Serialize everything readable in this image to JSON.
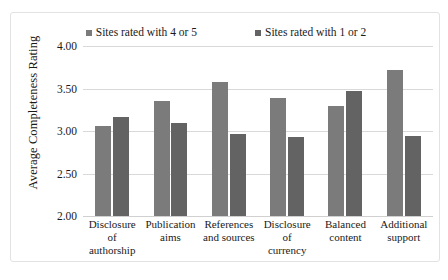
{
  "chart_data": {
    "type": "bar",
    "title": "",
    "xlabel": "",
    "ylabel": "Average Completeness Rating",
    "ylim": [
      2.0,
      4.0
    ],
    "ytick_labels": [
      "4.00",
      "3.50",
      "3.00",
      "2.50",
      "2.00"
    ],
    "ytick_values": [
      4.0,
      3.5,
      3.0,
      2.5,
      2.0
    ],
    "grid": true,
    "legend_position": "top",
    "categories": [
      "Disclosure of authorship",
      "Publication aims",
      "References and sources",
      "Disclosure of currency",
      "Balanced content",
      "Additional support"
    ],
    "category_lines": [
      [
        "Disclosure of",
        "authorship"
      ],
      [
        "Publication",
        "aims"
      ],
      [
        "References",
        "and sources"
      ],
      [
        "Disclosure of",
        "currency"
      ],
      [
        "Balanced",
        "content"
      ],
      [
        "Additional",
        "support"
      ]
    ],
    "series": [
      {
        "name": "Sites rated with 4 or 5",
        "color": "#7b7b7b",
        "values": [
          3.06,
          3.35,
          3.58,
          3.39,
          3.29,
          3.72
        ]
      },
      {
        "name": "Sites rated with 1 or 2",
        "color": "#636363",
        "values": [
          3.17,
          3.1,
          2.96,
          2.93,
          3.47,
          2.94
        ]
      }
    ]
  },
  "legend": {
    "marker_icon": "square-marker-icon",
    "entries": [
      {
        "label": "Sites rated with 4 or 5",
        "color": "#7b7b7b"
      },
      {
        "label": "Sites rated with 1 or 2",
        "color": "#636363"
      }
    ]
  },
  "axes": {
    "y_title": "Average Completeness Rating"
  },
  "colors": {
    "series_1": "#7b7b7b",
    "series_2": "#636363",
    "gridline": "#d9d9d9",
    "frame_border": "#e2e2e2",
    "background": "#ffffff",
    "text": "#1a1a1a"
  }
}
